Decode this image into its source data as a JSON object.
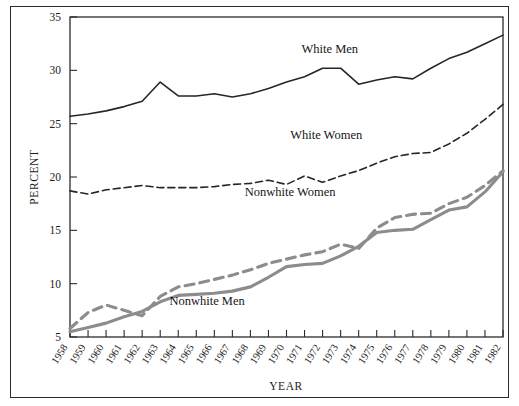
{
  "chart_data": {
    "type": "line",
    "title": "",
    "xlabel": "YEAR",
    "ylabel": "PERCENT",
    "xlim": [
      1958,
      1982
    ],
    "ylim": [
      5,
      35
    ],
    "yticks": [
      5,
      10,
      15,
      20,
      25,
      30,
      35
    ],
    "grid": false,
    "legend_position": "inline-annotations",
    "x": [
      1958,
      1959,
      1960,
      1961,
      1962,
      1963,
      1964,
      1965,
      1966,
      1967,
      1968,
      1969,
      1970,
      1971,
      1972,
      1973,
      1974,
      1975,
      1976,
      1977,
      1978,
      1979,
      1980,
      1981,
      1982
    ],
    "categories": [
      "1958",
      "1959",
      "1960",
      "1961",
      "1962",
      "1963",
      "1964",
      "1965",
      "1966",
      "1967",
      "1968",
      "1969",
      "1970",
      "1971",
      "1972",
      "1973",
      "1974",
      "1975",
      "1976",
      "1977",
      "1978",
      "1979",
      "1980",
      "1981",
      "1982"
    ],
    "series": [
      {
        "name": "White Men",
        "style": "solid",
        "color": "#262626",
        "label_x": 1972.4,
        "label_y": 31.6,
        "values": [
          25.7,
          25.9,
          26.2,
          26.6,
          27.1,
          28.9,
          27.6,
          27.6,
          27.8,
          27.5,
          27.8,
          28.3,
          28.9,
          29.4,
          30.2,
          30.2,
          28.7,
          29.1,
          29.4,
          29.2,
          30.2,
          31.1,
          31.7,
          32.5,
          33.3
        ]
      },
      {
        "name": "White Women",
        "style": "dashed",
        "color": "#262626",
        "label_x": 1972.2,
        "label_y": 23.6,
        "values": [
          18.7,
          18.4,
          18.8,
          19.0,
          19.2,
          19.0,
          19.0,
          19.0,
          19.1,
          19.3,
          19.4,
          19.7,
          19.3,
          20.1,
          19.5,
          20.1,
          20.6,
          21.3,
          21.9,
          22.2,
          22.3,
          23.1,
          24.1,
          25.4,
          26.8
        ]
      },
      {
        "name": "Nonwhite Women",
        "style": "dashed",
        "color": "#8c8c8c",
        "label_x": 1970.2,
        "label_y": 18.2,
        "values": [
          5.8,
          7.3,
          8.0,
          7.5,
          7.0,
          8.8,
          9.7,
          10.0,
          10.4,
          10.8,
          11.3,
          11.9,
          12.3,
          12.7,
          13.0,
          13.7,
          13.3,
          15.2,
          16.2,
          16.5,
          16.6,
          17.5,
          18.1,
          19.2,
          20.6
        ]
      },
      {
        "name": "Nonwhite Men",
        "style": "solid",
        "color": "#8c8c8c",
        "label_x": 1965.6,
        "label_y": 8.0,
        "values": [
          5.5,
          5.9,
          6.3,
          6.9,
          7.4,
          8.3,
          8.9,
          9.0,
          9.1,
          9.3,
          9.7,
          10.6,
          11.6,
          11.8,
          11.9,
          12.6,
          13.5,
          14.8,
          15.0,
          15.1,
          16.0,
          16.9,
          17.2,
          18.6,
          20.5
        ]
      }
    ]
  }
}
